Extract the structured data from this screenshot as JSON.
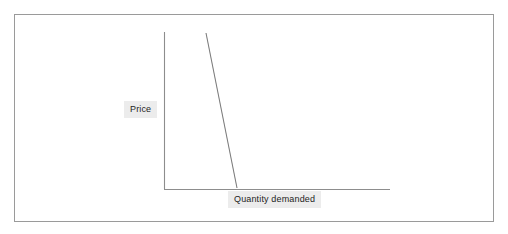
{
  "figure": {
    "frame": {
      "border_color": "#9a9a9a",
      "background_color": "#ffffff"
    },
    "axis_color": "#8d8d8d",
    "curve_color": "#7d7d7d",
    "label_background_color": "#ececec",
    "label_text_color": "#1d1d1d"
  },
  "labels": {
    "y_axis": "Price",
    "x_axis": "Quantity demanded"
  },
  "chart_data": {
    "type": "line",
    "title": "",
    "subtitle": "",
    "xlabel": "Quantity demanded",
    "ylabel": "Price",
    "grid": false,
    "legend": null,
    "axes": {
      "x_axis_drawn": true,
      "y_axis_drawn": true,
      "x_tick_labels": [],
      "y_tick_labels": [],
      "xlim": [
        0,
        100
      ],
      "ylim": [
        0,
        100
      ],
      "origin_px": [
        164,
        189
      ],
      "x_axis_end_px": [
        390,
        189
      ],
      "y_axis_top_px": [
        164,
        32
      ]
    },
    "series": [
      {
        "name": "Demand",
        "annotation": "",
        "x": [
          18.6,
          32.3
        ],
        "y": [
          99.4,
          0.6
        ],
        "points_px": [
          [
            206,
            33
          ],
          [
            237,
            188
          ]
        ],
        "slope": "negative",
        "description": "Steep downward-sloping demand curve"
      }
    ]
  }
}
